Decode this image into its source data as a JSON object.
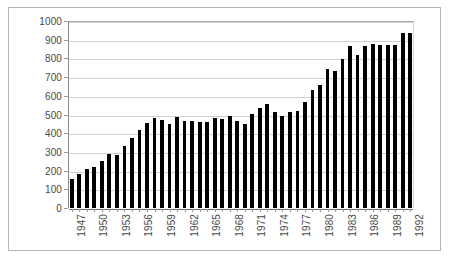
{
  "chart_data": {
    "type": "bar",
    "title": "",
    "subtitle": "",
    "xlabel": "",
    "ylabel": "",
    "ylim": [
      0,
      1000
    ],
    "ytick_step": 100,
    "yticks": [
      0,
      100,
      200,
      300,
      400,
      500,
      600,
      700,
      800,
      900,
      1000
    ],
    "ytick_labels": [
      "0",
      "100",
      "200",
      "300",
      "400",
      "500",
      "600",
      "700",
      "800",
      "900",
      "1000"
    ],
    "grid": true,
    "grid_axis": "y",
    "legend": false,
    "legend_position": "none",
    "bar_color": "#000000",
    "xtick_label_rotation": -90,
    "xtick_label_interval": 3,
    "xtick_labels_shown": [
      "1947",
      "1950",
      "1953",
      "1956",
      "1959",
      "1962",
      "1965",
      "1968",
      "1971",
      "1974",
      "1977",
      "1980",
      "1983",
      "1986",
      "1989",
      "1992"
    ],
    "categories": [
      "1947",
      "1948",
      "1949",
      "1950",
      "1951",
      "1952",
      "1953",
      "1954",
      "1955",
      "1956",
      "1957",
      "1958",
      "1959",
      "1960",
      "1961",
      "1962",
      "1963",
      "1964",
      "1965",
      "1966",
      "1967",
      "1968",
      "1969",
      "1970",
      "1971",
      "1972",
      "1973",
      "1974",
      "1975",
      "1976",
      "1977",
      "1978",
      "1979",
      "1980",
      "1981",
      "1982",
      "1983",
      "1984",
      "1985",
      "1986",
      "1987",
      "1988",
      "1989",
      "1990",
      "1991",
      "1992"
    ],
    "values": [
      155,
      180,
      210,
      222,
      253,
      288,
      282,
      333,
      372,
      415,
      452,
      482,
      470,
      447,
      489,
      466,
      465,
      458,
      462,
      482,
      476,
      492,
      463,
      451,
      504,
      534,
      554,
      515,
      492,
      516,
      521,
      568,
      630,
      660,
      742,
      733,
      797,
      868,
      820,
      866,
      877,
      874,
      874,
      870,
      936,
      938
    ],
    "series": [
      {
        "name": "series-1",
        "values": [
          155,
          180,
          210,
          222,
          253,
          288,
          282,
          333,
          372,
          415,
          452,
          482,
          470,
          447,
          489,
          466,
          465,
          458,
          462,
          482,
          476,
          492,
          463,
          451,
          504,
          534,
          554,
          515,
          492,
          516,
          521,
          568,
          630,
          660,
          742,
          733,
          797,
          868,
          820,
          866,
          877,
          874,
          874,
          870,
          936,
          938
        ]
      }
    ]
  }
}
